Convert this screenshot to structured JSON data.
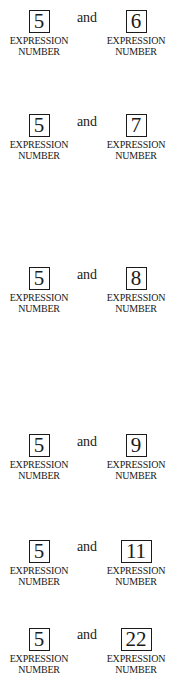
{
  "pairs": [
    {
      "left": {
        "number": "5",
        "label_line1": "EXPRESSION",
        "label_line2": "NUMBER"
      },
      "conjunction": "and",
      "right": {
        "number": "6",
        "label_line1": "EXPRESSION",
        "label_line2": "NUMBER"
      }
    },
    {
      "left": {
        "number": "5",
        "label_line1": "EXPRESSION",
        "label_line2": "NUMBER"
      },
      "conjunction": "and",
      "right": {
        "number": "7",
        "label_line1": "EXPRESSION",
        "label_line2": "NUMBER"
      }
    },
    {
      "left": {
        "number": "5",
        "label_line1": "EXPRESSION",
        "label_line2": "NUMBER"
      },
      "conjunction": "and",
      "right": {
        "number": "8",
        "label_line1": "EXPRESSION",
        "label_line2": "NUMBER"
      }
    },
    {
      "left": {
        "number": "5",
        "label_line1": "EXPRESSION",
        "label_line2": "NUMBER"
      },
      "conjunction": "and",
      "right": {
        "number": "9",
        "label_line1": "EXPRESSION",
        "label_line2": "NUMBER"
      }
    },
    {
      "left": {
        "number": "5",
        "label_line1": "EXPRESSION",
        "label_line2": "NUMBER"
      },
      "conjunction": "and",
      "right": {
        "number": "11",
        "label_line1": "EXPRESSION",
        "label_line2": "NUMBER"
      }
    },
    {
      "left": {
        "number": "5",
        "label_line1": "EXPRESSION",
        "label_line2": "NUMBER"
      },
      "conjunction": "and",
      "right": {
        "number": "22",
        "label_line1": "EXPRESSION",
        "label_line2": "NUMBER"
      }
    }
  ]
}
